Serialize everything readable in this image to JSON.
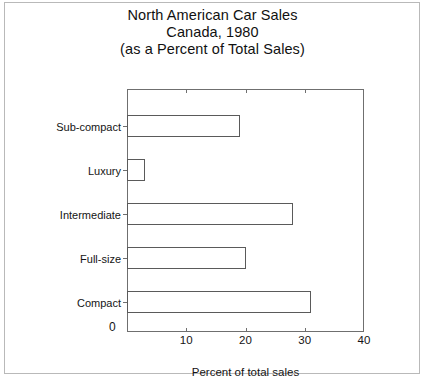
{
  "chart_data": {
    "type": "bar",
    "orientation": "horizontal",
    "title": "North American Car Sales Canada, 1980 (as a Percent of Total Sales)",
    "title_lines": [
      "North American Car Sales",
      "Canada, 1980",
      "(as a Percent of Total Sales)"
    ],
    "categories": [
      "Sub-compact",
      "Luxury",
      "Intermediate",
      "Full-size",
      "Compact"
    ],
    "values": [
      19,
      3,
      28,
      20,
      31
    ],
    "xlabel": "Percent of total sales",
    "ylabel": "",
    "xlim": [
      0,
      40
    ],
    "xticks": [
      0,
      10,
      20,
      30,
      40
    ],
    "xtick_labels": [
      "0",
      "10",
      "20",
      "30",
      "40"
    ],
    "grid": false,
    "legend": null,
    "bar_fill_color": "#ffffff",
    "bar_edge_color": "#5a5a5a",
    "axis_color": "#6f6f6f",
    "background_color": "#ffffff",
    "text_color": "#141414"
  }
}
